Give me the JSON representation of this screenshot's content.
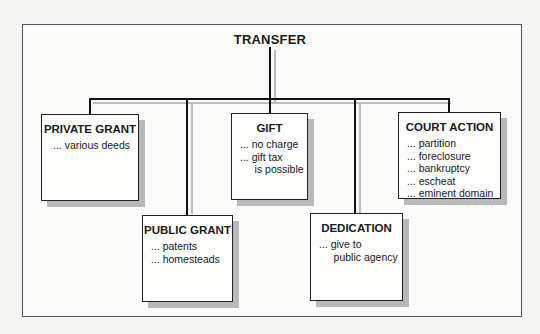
{
  "diagram": {
    "title": "TRANSFER",
    "nodes": [
      {
        "id": "private-grant",
        "label": "PRIVATE GRANT",
        "items": [
          "... various deeds"
        ]
      },
      {
        "id": "public-grant",
        "label": "PUBLIC GRANT",
        "items": [
          "... patents",
          "... homesteads"
        ]
      },
      {
        "id": "gift",
        "label": "GIFT",
        "items": [
          "... no charge",
          "... gift tax",
          "     is possible"
        ]
      },
      {
        "id": "dedication",
        "label": "DEDICATION",
        "items": [
          "... give to",
          "     public agency"
        ]
      },
      {
        "id": "court-action",
        "label": "COURT ACTION",
        "items": [
          "... partition",
          "... foreclosure",
          "... bankruptcy",
          "... escheat",
          "... eminent domain"
        ]
      }
    ],
    "edges": [
      {
        "from": "TRANSFER",
        "to": "private-grant"
      },
      {
        "from": "TRANSFER",
        "to": "public-grant"
      },
      {
        "from": "TRANSFER",
        "to": "gift"
      },
      {
        "from": "TRANSFER",
        "to": "dedication"
      },
      {
        "from": "TRANSFER",
        "to": "court-action"
      }
    ]
  }
}
